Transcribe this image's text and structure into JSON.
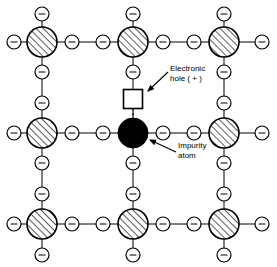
{
  "diagram": {
    "type": "crystal-lattice-schematic",
    "canvas": {
      "width": 277,
      "height": 267,
      "background": "#ffffff"
    },
    "colors": {
      "line": "#000000",
      "atom_fill": "#ffffff",
      "atom_hatch": "#000000",
      "impurity_fill": "#000000",
      "hole_fill": "#ffffff",
      "text": "#000000"
    },
    "geometry": {
      "atom_radius": 15,
      "electron_radius": 7,
      "impurity_radius": 15,
      "hole_size": 19,
      "grid_x": [
        42,
        133,
        224
      ],
      "grid_y": [
        42,
        133,
        224
      ],
      "edge_x": [
        14,
        262
      ],
      "edge_y": [
        14,
        255
      ],
      "mid_x": [
        72,
        103,
        163,
        194
      ],
      "mid_y": [
        72,
        103,
        163,
        194
      ]
    },
    "electron_symbol": "–",
    "hole_symbol": "",
    "atoms": [
      {
        "name": "atom-top-left",
        "x": 42,
        "y": 42,
        "kind": "hatched"
      },
      {
        "name": "atom-top-center",
        "x": 133,
        "y": 42,
        "kind": "hatched"
      },
      {
        "name": "atom-top-right",
        "x": 224,
        "y": 42,
        "kind": "hatched"
      },
      {
        "name": "atom-middle-left",
        "x": 42,
        "y": 133,
        "kind": "hatched"
      },
      {
        "name": "impurity-atom",
        "x": 133,
        "y": 133,
        "kind": "impurity"
      },
      {
        "name": "atom-middle-right",
        "x": 224,
        "y": 133,
        "kind": "hatched"
      },
      {
        "name": "atom-bottom-left",
        "x": 42,
        "y": 224,
        "kind": "hatched"
      },
      {
        "name": "atom-bottom-center",
        "x": 133,
        "y": 224,
        "kind": "hatched"
      },
      {
        "name": "atom-bottom-right",
        "x": 224,
        "y": 224,
        "kind": "hatched"
      }
    ],
    "hole": {
      "name": "electronic-hole",
      "x": 133,
      "y": 99,
      "charge": "+"
    },
    "labels": {
      "hole": {
        "line1": "Electronic",
        "line2": "hole ( + )",
        "x": 170,
        "y": 69
      },
      "impurity": {
        "line1": "Impurity",
        "line2": "atom",
        "x": 178,
        "y": 146
      }
    },
    "annotations": [
      {
        "name": "hole-arrow",
        "from_x": 168,
        "from_y": 72,
        "to_x": 146,
        "to_y": 93
      },
      {
        "name": "impurity-arrow",
        "from_x": 176,
        "from_y": 152,
        "to_x": 148,
        "to_y": 139
      }
    ]
  }
}
